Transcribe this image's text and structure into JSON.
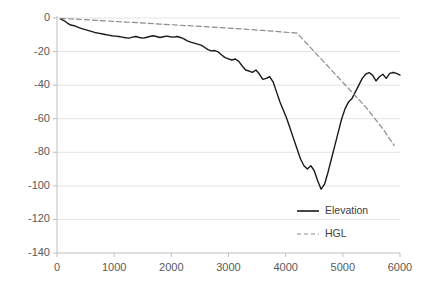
{
  "chart_data": {
    "type": "line",
    "title": "",
    "xlabel": "",
    "ylabel": "",
    "xlim": [
      0,
      6000
    ],
    "ylim": [
      -140,
      0
    ],
    "xticks": [
      0,
      1000,
      2000,
      3000,
      4000,
      5000,
      6000
    ],
    "yticks": [
      0,
      -20,
      -40,
      -60,
      -80,
      -100,
      -120,
      -140
    ],
    "xtick_labels": [
      "0",
      "1000",
      "2000",
      "3000",
      "4000",
      "5000",
      "6000"
    ],
    "ytick_labels": [
      "0",
      "-20",
      "-40",
      "-60",
      "-80",
      "-100",
      "-120",
      "-140"
    ],
    "grid": true,
    "grid_axis": "y",
    "legend_position": "inside-lower-right",
    "series": [
      {
        "name": "Elevation",
        "style": "solid",
        "color": "#1a1a1a",
        "width": 1.4,
        "x": [
          60,
          120,
          180,
          240,
          300,
          360,
          420,
          480,
          540,
          600,
          660,
          720,
          780,
          840,
          900,
          960,
          1020,
          1080,
          1140,
          1200,
          1260,
          1320,
          1380,
          1440,
          1500,
          1560,
          1620,
          1680,
          1740,
          1800,
          1860,
          1920,
          1980,
          2040,
          2100,
          2160,
          2220,
          2280,
          2340,
          2400,
          2460,
          2520,
          2580,
          2640,
          2700,
          2760,
          2820,
          2880,
          2940,
          3000,
          3060,
          3120,
          3180,
          3240,
          3300,
          3360,
          3420,
          3480,
          3540,
          3600,
          3660,
          3720,
          3780,
          3840,
          3900,
          3960,
          4020,
          4080,
          4140,
          4200,
          4260,
          4320,
          4380,
          4440,
          4500,
          4560,
          4620,
          4680,
          4740,
          4800,
          4860,
          4920,
          4980,
          5040,
          5100,
          5160,
          5220,
          5280,
          5340,
          5400,
          5460,
          5520,
          5580,
          5640,
          5700,
          5760,
          5820,
          5880
        ],
        "y": [
          -0.5,
          -1.5,
          -3.0,
          -4.2,
          -4.6,
          -5.4,
          -6.2,
          -6.8,
          -7.4,
          -8.0,
          -8.6,
          -9.0,
          -9.4,
          -9.8,
          -10.2,
          -10.6,
          -10.8,
          -11.0,
          -11.4,
          -11.8,
          -12.0,
          -11.4,
          -11.0,
          -11.6,
          -12.0,
          -11.6,
          -11.0,
          -10.6,
          -11.0,
          -11.6,
          -11.2,
          -10.8,
          -11.2,
          -11.4,
          -11.0,
          -11.6,
          -12.4,
          -13.6,
          -14.4,
          -15.0,
          -15.6,
          -16.2,
          -17.4,
          -18.8,
          -19.6,
          -19.4,
          -20.2,
          -22.0,
          -23.6,
          -24.4,
          -25.0,
          -24.4,
          -25.8,
          -28.6,
          -31.0,
          -31.6,
          -32.4,
          -31.0,
          -33.4,
          -36.6,
          -36.0,
          -35.0,
          -38.0,
          -44.0,
          -50.0,
          -55.0,
          -60.0,
          -66.0,
          -72.0,
          -78.0,
          -84.0,
          -88.0,
          -90.0,
          -88.0,
          -91.0,
          -97.0,
          -102.0,
          -99.0,
          -92.0,
          -84.0,
          -76.0,
          -68.0,
          -60.0,
          -54.0,
          -50.0,
          -48.0,
          -44.0,
          -40.0,
          -36.0,
          -33.5,
          -32.5,
          -34.0,
          -37.5,
          -35.0,
          -33.5,
          -36.0,
          -33.0,
          -32.5
        ]
      },
      {
        "name": "Elevation-tail",
        "style": "solid",
        "color": "#1a1a1a",
        "width": 1.4,
        "x": [
          5880,
          5940,
          6000
        ],
        "y": [
          -32.5,
          -33.0,
          -34.0
        ]
      },
      {
        "name": "HGL",
        "style": "dashed",
        "color": "#8c8c8c",
        "width": 1.2,
        "x": [
          60,
          600,
          1200,
          1800,
          2400,
          3000,
          3600,
          4200,
          4500,
          4800,
          5100,
          5400,
          5700,
          5900
        ],
        "y": [
          -0.2,
          -1.2,
          -2.4,
          -3.6,
          -4.8,
          -6.0,
          -7.4,
          -9.0,
          -20.0,
          -31.0,
          -42.0,
          -53.0,
          -66.0,
          -76.0
        ]
      }
    ],
    "legend": [
      {
        "label": "Elevation",
        "style": "solid",
        "color": "#1a1a1a"
      },
      {
        "label": "HGL",
        "style": "dashed",
        "color": "#8c8c8c"
      }
    ]
  }
}
